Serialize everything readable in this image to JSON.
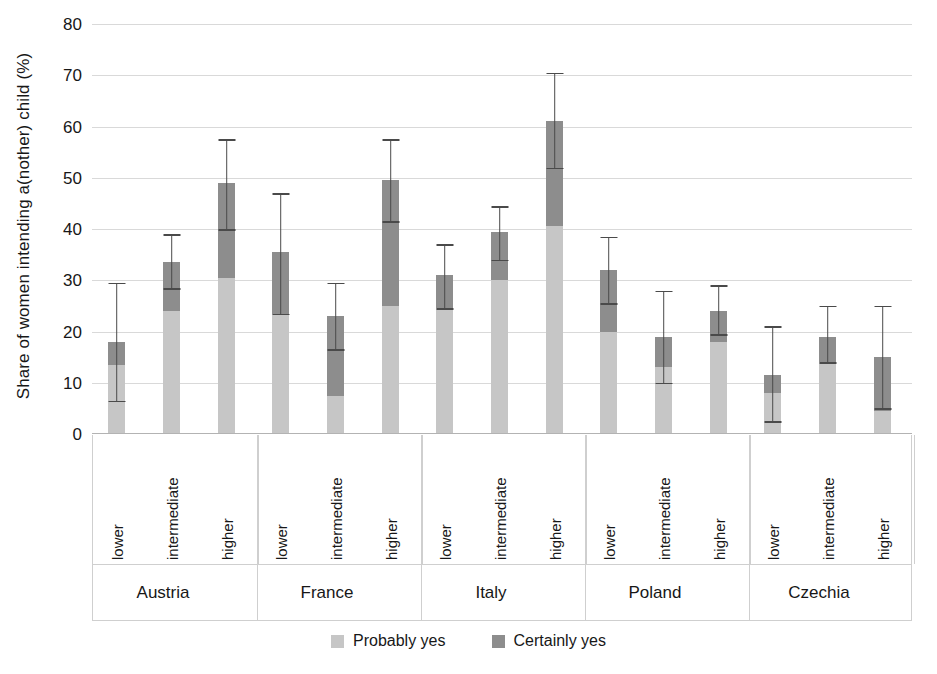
{
  "chart_data": {
    "type": "bar",
    "subtype": "stacked-bar-with-error-bars",
    "title": "",
    "xlabel": "",
    "ylabel": "Share of women intending a(nother) child (%)",
    "ylim": [
      0,
      80
    ],
    "yticks": [
      0,
      10,
      20,
      30,
      40,
      50,
      60,
      70,
      80
    ],
    "grid": true,
    "legend_position": "bottom",
    "groups": [
      "Austria",
      "France",
      "Italy",
      "Poland",
      "Czechia"
    ],
    "categories": [
      "lower",
      "intermediate",
      "higher"
    ],
    "series": [
      {
        "name": "Probably yes",
        "color": "#c6c6c6"
      },
      {
        "name": "Certainly yes",
        "color": "#8d8d8d"
      }
    ],
    "bars": [
      {
        "group": "Austria",
        "category": "lower",
        "probably_yes": 13.5,
        "certainly_yes": 4.5,
        "total": 18.0,
        "ci_low": 6.5,
        "ci_high": 29.5
      },
      {
        "group": "Austria",
        "category": "intermediate",
        "probably_yes": 24.0,
        "certainly_yes": 9.5,
        "total": 33.5,
        "ci_low": 28.5,
        "ci_high": 39.0
      },
      {
        "group": "Austria",
        "category": "higher",
        "probably_yes": 30.5,
        "certainly_yes": 18.5,
        "total": 49.0,
        "ci_low": 40.0,
        "ci_high": 57.5
      },
      {
        "group": "France",
        "category": "lower",
        "probably_yes": 23.5,
        "certainly_yes": 12.0,
        "total": 35.5,
        "ci_low": 23.5,
        "ci_high": 47.0
      },
      {
        "group": "France",
        "category": "intermediate",
        "probably_yes": 7.5,
        "certainly_yes": 15.5,
        "total": 23.0,
        "ci_low": 16.5,
        "ci_high": 29.5
      },
      {
        "group": "France",
        "category": "higher",
        "probably_yes": 25.0,
        "certainly_yes": 24.5,
        "total": 49.5,
        "ci_low": 41.5,
        "ci_high": 57.5
      },
      {
        "group": "Italy",
        "category": "lower",
        "probably_yes": 24.5,
        "certainly_yes": 6.5,
        "total": 31.0,
        "ci_low": 24.5,
        "ci_high": 37.0
      },
      {
        "group": "Italy",
        "category": "intermediate",
        "probably_yes": 30.0,
        "certainly_yes": 9.5,
        "total": 39.5,
        "ci_low": 34.0,
        "ci_high": 44.5
      },
      {
        "group": "Italy",
        "category": "higher",
        "probably_yes": 40.5,
        "certainly_yes": 20.5,
        "total": 61.0,
        "ci_low": 52.0,
        "ci_high": 70.5
      },
      {
        "group": "Poland",
        "category": "lower",
        "probably_yes": 20.0,
        "certainly_yes": 12.0,
        "total": 32.0,
        "ci_low": 25.5,
        "ci_high": 38.5
      },
      {
        "group": "Poland",
        "category": "intermediate",
        "probably_yes": 13.0,
        "certainly_yes": 6.0,
        "total": 19.0,
        "ci_low": 10.0,
        "ci_high": 28.0
      },
      {
        "group": "Poland",
        "category": "higher",
        "probably_yes": 18.0,
        "certainly_yes": 6.0,
        "total": 24.0,
        "ci_low": 19.5,
        "ci_high": 29.0
      },
      {
        "group": "Czechia",
        "category": "lower",
        "probably_yes": 8.0,
        "certainly_yes": 3.5,
        "total": 11.5,
        "ci_low": 2.5,
        "ci_high": 21.0
      },
      {
        "group": "Czechia",
        "category": "intermediate",
        "probably_yes": 14.0,
        "certainly_yes": 5.0,
        "total": 19.0,
        "ci_low": 14.0,
        "ci_high": 25.0
      },
      {
        "group": "Czechia",
        "category": "higher",
        "probably_yes": 4.5,
        "certainly_yes": 10.5,
        "total": 15.0,
        "ci_low": 5.0,
        "ci_high": 25.0
      }
    ]
  },
  "axis": {
    "y_title": "Share of women intending a(nother) child (%)"
  },
  "legend": {
    "items": [
      {
        "label": "Probably yes",
        "color": "#c6c6c6"
      },
      {
        "label": "Certainly yes",
        "color": "#8d8d8d"
      }
    ]
  },
  "colors": {
    "probably_yes": "#c6c6c6",
    "certainly_yes": "#8d8d8d",
    "gridline": "#d9d9d9",
    "error_bar": "#4a4a4a",
    "text": "#171717"
  }
}
